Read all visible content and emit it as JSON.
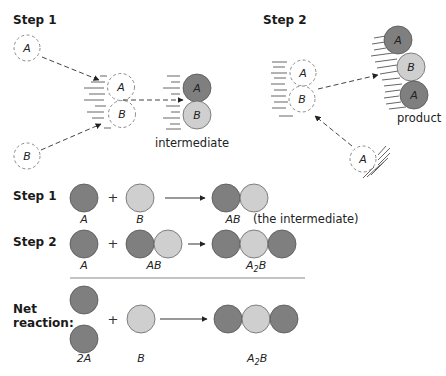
{
  "colors": {
    "atom_a": "#7f7f7f",
    "atom_b": "#cfcfcf",
    "stroke": "#555555",
    "dashed": "#8a8a8a",
    "background": "#ffffff"
  },
  "top_diagram": {
    "step1": {
      "title": "Step 1",
      "reactant_a_label": "A",
      "reactant_b_label": "B",
      "collision_a_label": "A",
      "collision_b_label": "B",
      "intermediate_a_label": "A",
      "intermediate_b_label": "B",
      "intermediate_caption": "intermediate"
    },
    "step2": {
      "title": "Step 2",
      "intermediate_a_label": "A",
      "intermediate_b_label": "B",
      "incoming_a_label": "A",
      "product_atoms": [
        "A",
        "B",
        "A"
      ],
      "product_caption": "product"
    }
  },
  "equations": {
    "step1": {
      "title": "Step 1",
      "reactant1_label": "A",
      "reactant2_label": "B",
      "product_label": "AB",
      "product_note": "(the intermediate)",
      "plus": "+"
    },
    "step2": {
      "title": "Step 2",
      "reactant1_label": "A",
      "reactant2_label": "AB",
      "product_label_main": "A",
      "product_label_sub": "2",
      "product_label_tail": "B",
      "plus": "+"
    },
    "net": {
      "title_line1": "Net",
      "title_line2": "reaction:",
      "reactant1_label": "2A",
      "reactant2_label": "B",
      "product_label_main": "A",
      "product_label_sub": "2",
      "product_label_tail": "B",
      "plus": "+"
    }
  }
}
